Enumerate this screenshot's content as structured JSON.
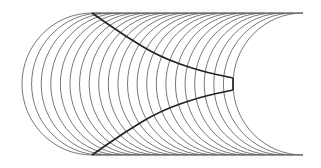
{
  "diagram": {
    "type": "curve-family",
    "width": 321,
    "height": 168,
    "colors": {
      "background": "#ffffff",
      "arc_stroke": "#555555",
      "boundary_stroke": "#222222"
    },
    "frame": {
      "top_y": 13,
      "bottom_y": 155,
      "center_y": 84
    },
    "arcs": {
      "count": 23,
      "first_left_x": 22,
      "last_left_x": 233,
      "horizontal_radius": 70
    },
    "boundary_curves": {
      "top": [
        [
          92,
          13
        ],
        [
          125,
          36
        ],
        [
          160,
          57
        ],
        [
          200,
          71
        ],
        [
          233,
          78
        ]
      ],
      "bottom": [
        [
          92,
          155
        ],
        [
          125,
          132
        ],
        [
          160,
          111
        ],
        [
          200,
          97
        ],
        [
          233,
          90
        ]
      ],
      "right_segment": [
        [
          233,
          78
        ],
        [
          233,
          90
        ]
      ]
    }
  }
}
